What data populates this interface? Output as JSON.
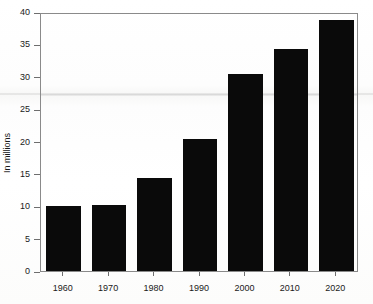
{
  "chart_data": {
    "type": "bar",
    "title": "",
    "subtitle": "",
    "xlabel": "",
    "ylabel": "In millions",
    "categories": [
      "1960",
      "1970",
      "1980",
      "1990",
      "2000",
      "2010",
      "2020"
    ],
    "values": [
      10.1,
      10.2,
      14.3,
      20.4,
      30.5,
      34.3,
      38.7
    ],
    "ylim": [
      0,
      40
    ],
    "ytick_labels": [
      "0",
      "5",
      "10",
      "15",
      "20",
      "25",
      "30",
      "35",
      "40"
    ],
    "ytick_values": [
      0,
      5,
      10,
      15,
      20,
      25,
      30,
      35,
      40
    ],
    "grid": false,
    "legend": null,
    "bar_color": "#0a0a0a",
    "axis_color": "#8a8a8a",
    "background_color": "#fdfdfc"
  },
  "figure": {
    "watermark_text": ""
  }
}
